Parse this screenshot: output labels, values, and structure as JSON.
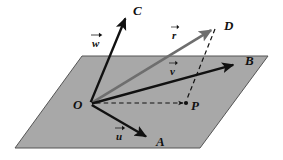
{
  "figure": {
    "width": 283,
    "height": 160,
    "background_color": "#ffffff"
  },
  "plane": {
    "name": "gray-parallelogram-plane",
    "fill_color": "#a8a8a8",
    "stroke_color": "#555555",
    "corners": [
      {
        "x": 82,
        "y": 56
      },
      {
        "x": 268,
        "y": 56
      },
      {
        "x": 200,
        "y": 148
      },
      {
        "x": 15,
        "y": 148
      }
    ]
  },
  "origin": {
    "label": "O",
    "x": 90,
    "y": 104,
    "label_x": 73,
    "label_y": 98
  },
  "points": [
    {
      "id": "A",
      "label": "A",
      "x": 152,
      "y": 140,
      "label_x": 156,
      "label_y": 135
    },
    {
      "id": "B",
      "label": "B",
      "x": 240,
      "y": 63,
      "label_x": 245,
      "label_y": 54
    },
    {
      "id": "C",
      "label": "C",
      "x": 128,
      "y": 12,
      "label_x": 133,
      "label_y": 4
    },
    {
      "id": "D",
      "label": "D",
      "x": 218,
      "y": 26,
      "label_x": 224,
      "label_y": 19
    },
    {
      "id": "P",
      "label": "P",
      "x": 186,
      "y": 103,
      "label_x": 191,
      "label_y": 99
    }
  ],
  "vectors": [
    {
      "id": "u",
      "label": "u",
      "from": "O",
      "to": "A",
      "color": "#111111",
      "style": "solid",
      "label_x": 116,
      "label_y": 131
    },
    {
      "id": "v",
      "label": "v",
      "from": "O",
      "to": "B",
      "color": "#111111",
      "style": "solid",
      "label_x": 170,
      "label_y": 66
    },
    {
      "id": "w",
      "label": "w",
      "from": "O",
      "to": "C",
      "color": "#111111",
      "style": "solid",
      "label_x": 92,
      "label_y": 38
    },
    {
      "id": "r",
      "label": "r",
      "from": "O",
      "to": "D",
      "color": "#6e6e6e",
      "style": "solid",
      "label_x": 172,
      "label_y": 30
    }
  ],
  "dashed_lines": [
    {
      "id": "O-to-P",
      "description": "dashed projection line from origin to point P",
      "from": {
        "x": 96,
        "y": 103
      },
      "to": {
        "x": 183,
        "y": 103
      },
      "color": "#111111",
      "arrowhead": true
    },
    {
      "id": "P-to-D",
      "description": "dashed vertical drop line from D to point P",
      "from": {
        "x": 215,
        "y": 29
      },
      "to": {
        "x": 187,
        "y": 99
      },
      "color": "#111111",
      "arrowhead": false
    }
  ],
  "colors": {
    "plane_fill": "#a8a8a8",
    "plane_edge": "#555555",
    "vector_black": "#111111",
    "vector_gray": "#6e6e6e",
    "background": "#ffffff"
  }
}
